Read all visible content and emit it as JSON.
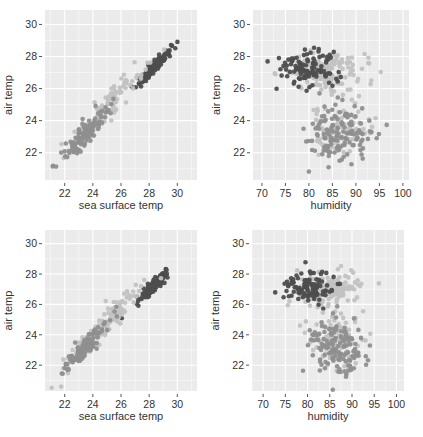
{
  "colors": {
    "panel_bg": "#ebebeb",
    "grid": "#ffffff",
    "dark": "#4d4d4d",
    "medium": "#8f8f8f",
    "light": "#c2c2c2",
    "tick_text": "#4d4d4d",
    "label_text": "#222222"
  },
  "chart_data": [
    {
      "type": "scatter",
      "id": "top-left",
      "xlabel": "sea surface temp",
      "ylabel": "air temp",
      "xticks": [
        22,
        24,
        26,
        28,
        30
      ],
      "yticks": [
        22,
        24,
        26,
        28,
        30
      ],
      "xlim": [
        20.6,
        31.4
      ],
      "ylim": [
        20.3,
        30.9
      ],
      "frame": {
        "x": 45,
        "y": 10,
        "w": 152,
        "h": 170
      },
      "groups": [
        {
          "name": "dark",
          "color": "dark",
          "cx": 28.3,
          "cy": 27.3,
          "sx": 0.55,
          "sy": 0.55,
          "n": 110,
          "slope": 0.9,
          "seed": 11
        },
        {
          "name": "light",
          "color": "light",
          "cx": 24.8,
          "cy": 24.6,
          "sx": 1.4,
          "sy": 1.3,
          "n": 120,
          "slope": 0.95,
          "seed": 12
        },
        {
          "name": "medium",
          "color": "medium",
          "cx": 23.4,
          "cy": 23.1,
          "sx": 0.9,
          "sy": 0.9,
          "n": 120,
          "slope": 0.95,
          "seed": 13
        }
      ]
    },
    {
      "type": "scatter",
      "id": "top-right",
      "xlabel": "humidity",
      "ylabel": "air temp",
      "xticks": [
        70,
        75,
        80,
        85,
        90,
        95,
        100
      ],
      "yticks": [
        22,
        24,
        26,
        28,
        30
      ],
      "xlim": [
        68.1,
        101.3
      ],
      "ylim": [
        20.3,
        30.9
      ],
      "frame": {
        "x": 253,
        "y": 10,
        "w": 156,
        "h": 170
      },
      "groups": [
        {
          "name": "light",
          "color": "light",
          "cx": 84,
          "cy": 27.0,
          "sx": 4.5,
          "sy": 0.6,
          "n": 150,
          "slope": 0,
          "seed": 21
        },
        {
          "name": "dark",
          "color": "dark",
          "cx": 80,
          "cy": 27.2,
          "sx": 3.3,
          "sy": 0.6,
          "n": 100,
          "slope": 0,
          "seed": 22
        },
        {
          "name": "light2",
          "color": "light",
          "cx": 86.5,
          "cy": 23.6,
          "sx": 3.2,
          "sy": 0.8,
          "n": 90,
          "slope": 0,
          "seed": 23
        },
        {
          "name": "medium",
          "color": "medium",
          "cx": 87,
          "cy": 23.2,
          "sx": 3.5,
          "sy": 0.9,
          "n": 140,
          "slope": 0,
          "seed": 24
        }
      ]
    },
    {
      "type": "scatter",
      "id": "bottom-left",
      "xlabel": "sea surface temp",
      "ylabel": "air temp",
      "xticks": [
        22,
        24,
        26,
        28,
        30
      ],
      "yticks": [
        22,
        24,
        26,
        28,
        30
      ],
      "xlim": [
        20.6,
        31.4
      ],
      "ylim": [
        20.3,
        30.9
      ],
      "frame": {
        "x": 45,
        "y": 230,
        "w": 152,
        "h": 161
      },
      "groups": [
        {
          "name": "dark",
          "color": "dark",
          "cx": 28.3,
          "cy": 27.2,
          "sx": 0.55,
          "sy": 0.55,
          "n": 110,
          "slope": 0.9,
          "seed": 31
        },
        {
          "name": "light",
          "color": "light",
          "cx": 24.8,
          "cy": 24.6,
          "sx": 1.4,
          "sy": 1.3,
          "n": 120,
          "slope": 0.95,
          "seed": 32
        },
        {
          "name": "medium",
          "color": "medium",
          "cx": 23.4,
          "cy": 23.1,
          "sx": 0.9,
          "sy": 0.9,
          "n": 120,
          "slope": 0.95,
          "seed": 33
        }
      ]
    },
    {
      "type": "scatter",
      "id": "bottom-right",
      "xlabel": "humidity",
      "ylabel": "air temp",
      "xticks": [
        70,
        75,
        80,
        85,
        90,
        95,
        100
      ],
      "yticks": [
        22,
        24,
        26,
        28,
        30
      ],
      "xlim": [
        67.5,
        101.7
      ],
      "ylim": [
        20.3,
        30.9
      ],
      "frame": {
        "x": 252,
        "y": 230,
        "w": 152,
        "h": 161
      },
      "groups": [
        {
          "name": "light",
          "color": "light",
          "cx": 85,
          "cy": 27.0,
          "sx": 4.2,
          "sy": 0.6,
          "n": 150,
          "slope": 0,
          "seed": 41
        },
        {
          "name": "dark",
          "color": "dark",
          "cx": 80,
          "cy": 27.2,
          "sx": 3.0,
          "sy": 0.6,
          "n": 100,
          "slope": 0,
          "seed": 42
        },
        {
          "name": "light2",
          "color": "light",
          "cx": 86,
          "cy": 23.6,
          "sx": 3.0,
          "sy": 0.8,
          "n": 90,
          "slope": 0,
          "seed": 43
        },
        {
          "name": "medium",
          "color": "medium",
          "cx": 86.5,
          "cy": 23.2,
          "sx": 3.3,
          "sy": 0.9,
          "n": 140,
          "slope": 0,
          "seed": 44
        }
      ]
    }
  ]
}
